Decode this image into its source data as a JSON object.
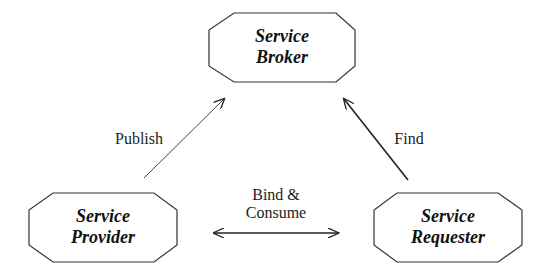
{
  "diagram": {
    "nodes": [
      {
        "id": "broker",
        "line1": "Service",
        "line2": "Broker"
      },
      {
        "id": "provider",
        "line1": "Service",
        "line2": "Provider"
      },
      {
        "id": "requester",
        "line1": "Service",
        "line2": "Requester"
      }
    ],
    "edges": {
      "publish": "Publish",
      "find": "Find",
      "bind_line1": "Bind &",
      "bind_line2": "Consume"
    },
    "colors": {
      "stroke": "#333333",
      "text": "#111111",
      "background": "#ffffff"
    }
  }
}
